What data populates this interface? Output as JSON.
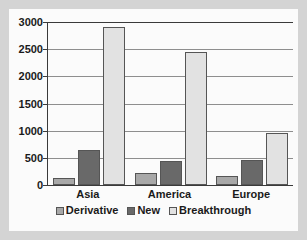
{
  "chart_data": {
    "type": "bar",
    "title": "",
    "xlabel": "",
    "ylabel": "",
    "categories": [
      "Asia",
      "America",
      "Europe"
    ],
    "series": [
      {
        "name": "Derivative",
        "color": "#a8a8a8",
        "values": [
          130,
          230,
          170
        ]
      },
      {
        "name": "New",
        "color": "#696969",
        "values": [
          650,
          450,
          460
        ]
      },
      {
        "name": "Breakthrough",
        "color": "#e2e2e2",
        "values": [
          2900,
          2450,
          960
        ]
      }
    ],
    "ylim": [
      0,
      3000
    ],
    "yticks": [
      0,
      500,
      1000,
      1500,
      2000,
      2500,
      3000
    ],
    "ytick_labels": [
      "0",
      "500",
      "1000",
      "1500",
      "2000",
      "2500",
      "3000"
    ],
    "grid": true,
    "legend_position": "bottom"
  },
  "figure": {
    "background_color": "#d4d4d4",
    "panel_color": "#fbfbfb",
    "axis_color": "#3a3a3a",
    "grid_color": "#8e8e8e"
  }
}
